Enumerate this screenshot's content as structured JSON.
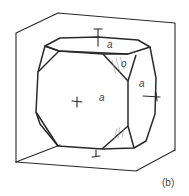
{
  "figure": {
    "caption": "(b)",
    "labels": {
      "top_face": "a",
      "front_face": "a",
      "right_face": "a",
      "octahedron_face": "o"
    }
  }
}
